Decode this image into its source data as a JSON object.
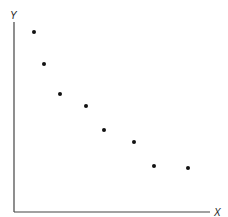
{
  "chart_data": {
    "type": "scatter",
    "title": "",
    "xlabel": "X",
    "ylabel": "Y",
    "grid": false,
    "legend": null,
    "x": [
      1,
      1.5,
      2.3,
      3.6,
      4.5,
      6.0,
      7.0,
      8.7
    ],
    "y": [
      9.0,
      7.4,
      5.9,
      5.3,
      4.1,
      3.5,
      2.3,
      2.2
    ],
    "xlim": [
      0,
      10
    ],
    "ylim": [
      0,
      10
    ]
  },
  "axes": {
    "x_label": "X",
    "y_label": "Y"
  }
}
